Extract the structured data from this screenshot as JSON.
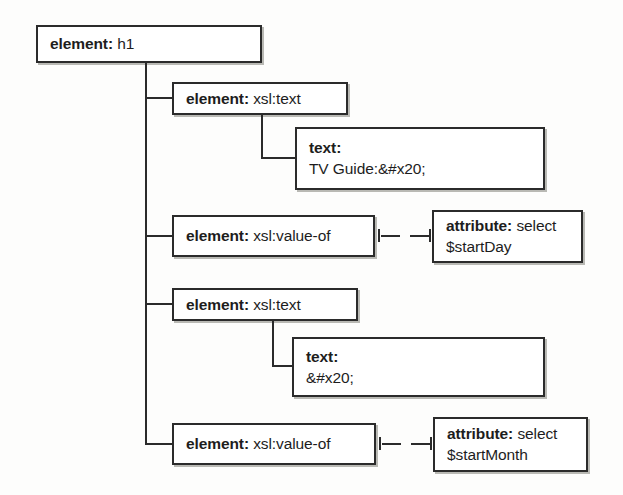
{
  "diagram": {
    "type": "xslt-stylesheet-tree",
    "nodes": [
      {
        "id": "root",
        "keyword": "element:",
        "value": " h1",
        "lines": [
          "element: h1"
        ]
      },
      {
        "id": "text1",
        "keyword": "element:",
        "value": " xsl:text",
        "lines": [
          "element: xsl:text"
        ]
      },
      {
        "id": "text1-content",
        "keyword": "text:",
        "value": "TV Guide:&#x20;",
        "lines": [
          "text:",
          "TV Guide:&#x20;"
        ]
      },
      {
        "id": "valueof1",
        "keyword": "element:",
        "value": " xsl:value-of",
        "lines": [
          "element: xsl:value-of"
        ]
      },
      {
        "id": "attr1",
        "keyword": "attribute:",
        "value": " select",
        "lines": [
          "attribute: select",
          "$startDay"
        ]
      },
      {
        "id": "text2",
        "keyword": "element:",
        "value": " xsl:text",
        "lines": [
          "element: xsl:text"
        ]
      },
      {
        "id": "text2-content",
        "keyword": "text:",
        "value": "&#x20;",
        "lines": [
          "text:",
          "&#x20;"
        ]
      },
      {
        "id": "valueof2",
        "keyword": "element:",
        "value": " xsl:value-of",
        "lines": [
          "element: xsl:value-of"
        ]
      },
      {
        "id": "attr2",
        "keyword": "attribute:",
        "value": " select",
        "lines": [
          "attribute: select",
          "$startMonth"
        ]
      }
    ],
    "labels": {
      "root_kw": "element:",
      "root_val": " h1",
      "text1_kw": "element:",
      "text1_val": " xsl:text",
      "text1c_kw": "text:",
      "text1c_val": "TV Guide:&#x20;",
      "valueof1_kw": "element:",
      "valueof1_val": " xsl:value-of",
      "attr1_kw": "attribute:",
      "attr1_val": " select",
      "attr1_line2": "$startDay",
      "text2_kw": "element:",
      "text2_val": " xsl:text",
      "text2c_kw": "text:",
      "text2c_val": "&#x20;",
      "valueof2_kw": "element:",
      "valueof2_val": " xsl:value-of",
      "attr2_kw": "attribute:",
      "attr2_val": " select",
      "attr2_line2": "$startMonth"
    },
    "colors": {
      "border": "#2b2b2b",
      "text": "#1d1d1d",
      "background": "#fdfdfc",
      "box_fill": "#ffffff",
      "shadow": "#b9b9b4"
    }
  }
}
